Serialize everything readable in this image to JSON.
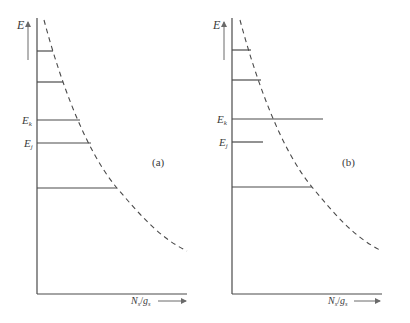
{
  "figure": {
    "panels": [
      {
        "id": "a",
        "tag": "(a)",
        "y_axis_label": "E",
        "x_axis_label_N": "N",
        "x_axis_label_N_sub": "s",
        "x_axis_label_slash": "/",
        "x_axis_label_g": "g",
        "x_axis_label_g_sub": "s",
        "level_labels": [
          {
            "main": "E",
            "sub": "k"
          },
          {
            "main": "E",
            "sub": "j"
          }
        ],
        "levels": [
          {
            "y": 51,
            "x_end": 53
          },
          {
            "y": 82,
            "x_end": 63
          },
          {
            "y": 120,
            "x_end": 80,
            "label": "E_k"
          },
          {
            "y": 143,
            "x_end": 91,
            "label": "E_j"
          },
          {
            "y": 188,
            "x_end": 117
          }
        ]
      },
      {
        "id": "b",
        "tag": "(b)",
        "y_axis_label": "E",
        "x_axis_label_N": "N",
        "x_axis_label_N_sub": "s",
        "x_axis_label_slash": "/",
        "x_axis_label_g": "g",
        "x_axis_label_g_sub": "s",
        "level_labels": [
          {
            "main": "E",
            "sub": "k"
          },
          {
            "main": "E",
            "sub": "j"
          }
        ],
        "levels": [
          {
            "y": 50,
            "x_end": 251
          },
          {
            "y": 80,
            "x_end": 261
          },
          {
            "y": 119,
            "x_end": 323,
            "label": "E_k"
          },
          {
            "y": 142,
            "x_end": 263,
            "label": "E_j"
          },
          {
            "y": 187,
            "x_end": 312
          }
        ]
      }
    ],
    "colors": {
      "line": "#4a4a4a",
      "text": "#3a3a3a",
      "background": "#ffffff"
    }
  }
}
